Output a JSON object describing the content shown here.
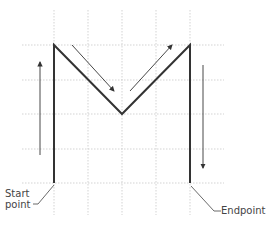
{
  "diagram": {
    "grid": {
      "x_lines": [
        54,
        88,
        122,
        156,
        190
      ],
      "y_lines": [
        45,
        80,
        114,
        149,
        183
      ],
      "x_extent": [
        22,
        224
      ],
      "y_extent": [
        10,
        215
      ],
      "color": "#c8c8c8"
    },
    "stroke": {
      "points": "54,183 54,45 122,114 190,45 190,183",
      "color": "#333333"
    },
    "arrows": [
      {
        "name": "up-arrow",
        "from": [
          40,
          155
        ],
        "to": [
          40,
          62
        ]
      },
      {
        "name": "down-right-arrow",
        "from": [
          72,
          45
        ],
        "to": [
          114,
          91
        ]
      },
      {
        "name": "up-right-arrow",
        "from": [
          130,
          91
        ],
        "to": [
          172,
          45
        ]
      },
      {
        "name": "down-arrow",
        "from": [
          203,
          65
        ],
        "to": [
          203,
          168
        ]
      }
    ],
    "labels": {
      "start": "Start\npoint",
      "end": "Endpoint"
    }
  }
}
